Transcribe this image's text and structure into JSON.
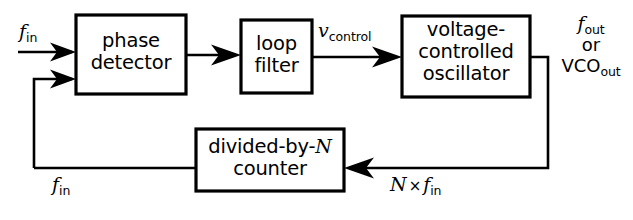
{
  "diagram": {
    "type": "block-diagram",
    "background_color": "#ffffff",
    "line_color": "#000000",
    "blocks": [
      {
        "id": "phase-detector",
        "lines": [
          "phase",
          "detector"
        ],
        "x": 76,
        "y": 15,
        "w": 110,
        "h": 79
      },
      {
        "id": "loop-filter",
        "lines": [
          "loop",
          "filter"
        ],
        "x": 241,
        "y": 20,
        "w": 71,
        "h": 73
      },
      {
        "id": "vco",
        "lines": [
          "voltage-",
          "controlled",
          "oscillator"
        ],
        "x": 402,
        "y": 16,
        "w": 128,
        "h": 81
      },
      {
        "id": "divider",
        "lines": [
          "divided-by-N",
          "counter"
        ],
        "x": 196,
        "y": 129,
        "w": 148,
        "h": 62
      }
    ],
    "signals": {
      "input_top": {
        "symbol": "f",
        "subscript": "in"
      },
      "feedback_left": {
        "symbol": "f",
        "subscript": "in"
      },
      "control": {
        "symbol": "v",
        "subscript": "control"
      },
      "output_line1": {
        "symbol": "f",
        "subscript": "out"
      },
      "output_or": "or",
      "output_line3": {
        "symbol": "VCO",
        "subscript": "out"
      },
      "feedback_bottom": {
        "prefix": "N",
        "operator": "×",
        "symbol": "f",
        "subscript": "in"
      }
    }
  }
}
